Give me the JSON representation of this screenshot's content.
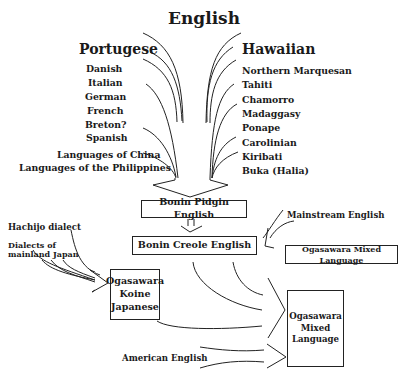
{
  "title": "English",
  "sources": {
    "left_header": "Portugese",
    "left_items": [
      "Danish",
      "Italian",
      "German",
      "French",
      "Breton?",
      "Spanish",
      "Languages of China",
      "Languages of the Philippines"
    ],
    "right_header": "Hawaiian",
    "right_items": [
      "Northern Marquesan",
      "Tahiti",
      "Chamorro",
      "Madaggasy",
      "Ponape",
      "Carolinian",
      "Kiribati",
      "Buka (Halia)"
    ]
  },
  "nodes": {
    "pidgin": "Bonin Pidgin English",
    "creole": "Bonin Creole English",
    "mainstream": "Mainstream English",
    "mixed_small": "Ogasawara Mixed Language",
    "hachijo": "Hachijo dialect",
    "mainland": "Dialects of\nmainland Japan",
    "koine": [
      "Ogasawara",
      "Koine",
      "Japanese"
    ],
    "mixed_big": [
      "Ogasawara",
      "Mixed",
      "Language"
    ],
    "american": "American English"
  }
}
